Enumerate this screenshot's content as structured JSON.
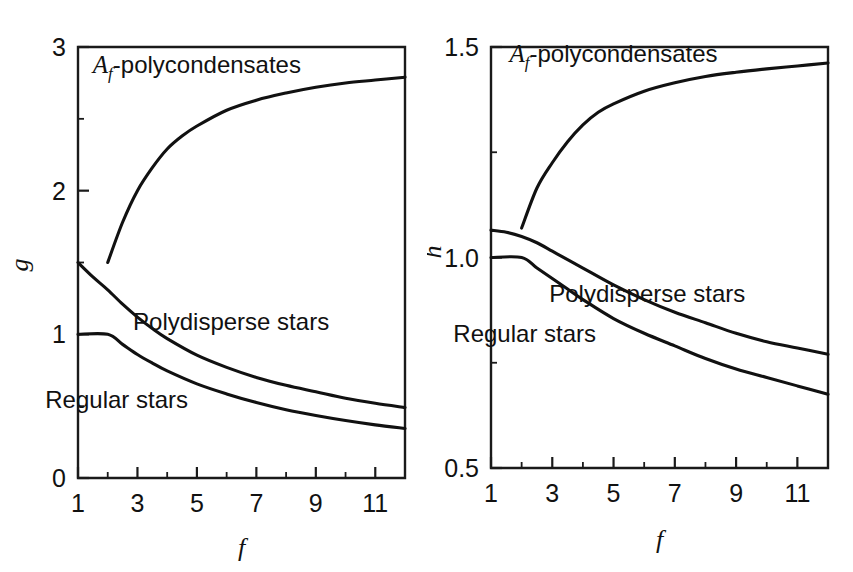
{
  "figure": {
    "background_color": "#ffffff",
    "line_color": "#111111",
    "panel_count": 2
  },
  "chart_data": [
    {
      "type": "line",
      "panel": "left",
      "title": "",
      "xlabel": "f",
      "ylabel": "g",
      "xlim": [
        1,
        12
      ],
      "ylim": [
        0,
        3
      ],
      "grid": false,
      "legend": "inline-annotations",
      "x_major_ticks": [
        1,
        3,
        5,
        7,
        9,
        11
      ],
      "x_major_tick_labels": [
        "1",
        "3",
        "5",
        "7",
        "9",
        "11"
      ],
      "x_minor_ticks": [
        2,
        4,
        6,
        8,
        10,
        12
      ],
      "y_major_ticks": [
        0,
        1,
        2,
        3
      ],
      "y_major_tick_labels": [
        "0",
        "1",
        "2",
        "3"
      ],
      "y_minor_ticks": [
        0.5,
        1.5,
        2.5
      ],
      "series": [
        {
          "name": "Af-polycondensates",
          "label": "A_f-polycondensates",
          "label_x": 5.0,
          "label_y": 2.82,
          "x": [
            2,
            2.5,
            3,
            3.5,
            4,
            4.5,
            5,
            6,
            7,
            8,
            9,
            10,
            11,
            12
          ],
          "values": [
            1.5,
            1.78,
            2.0,
            2.16,
            2.29,
            2.38,
            2.45,
            2.56,
            2.63,
            2.68,
            2.72,
            2.75,
            2.77,
            2.79
          ]
        },
        {
          "name": "Polydisperse stars",
          "label": "Polydisperse stars",
          "label_x": 6.15,
          "label_y": 1.03,
          "x": [
            1,
            1.5,
            2,
            2.5,
            3,
            3.5,
            4,
            5,
            6,
            7,
            8,
            9,
            10,
            11,
            12
          ],
          "values": [
            1.5,
            1.4,
            1.31,
            1.21,
            1.12,
            1.04,
            0.97,
            0.855,
            0.77,
            0.7,
            0.645,
            0.6,
            0.555,
            0.52,
            0.49
          ]
        },
        {
          "name": "Regular stars",
          "label": "Regular stars",
          "label_x": 2.3,
          "label_y": 0.49,
          "x": [
            1,
            2,
            2.5,
            3,
            3.5,
            4,
            5,
            6,
            7,
            8,
            9,
            10,
            11,
            12
          ],
          "values": [
            1.0,
            1.0,
            0.93,
            0.86,
            0.8,
            0.745,
            0.655,
            0.585,
            0.525,
            0.475,
            0.435,
            0.4,
            0.37,
            0.345
          ]
        }
      ]
    },
    {
      "type": "line",
      "panel": "right",
      "title": "",
      "xlabel": "f",
      "ylabel": "h",
      "xlim": [
        1,
        12
      ],
      "ylim": [
        0.5,
        1.5
      ],
      "grid": false,
      "legend": "inline-annotations",
      "x_major_ticks": [
        1,
        3,
        5,
        7,
        9,
        11
      ],
      "x_major_tick_labels": [
        "1",
        "3",
        "5",
        "7",
        "9",
        "11"
      ],
      "x_minor_ticks": [
        2,
        4,
        6,
        8,
        10,
        12
      ],
      "y_major_ticks": [
        0.5,
        1.0,
        1.5
      ],
      "y_major_tick_labels": [
        "0.5",
        "1.0",
        "1.5"
      ],
      "y_minor_ticks": [
        0.75,
        1.25
      ],
      "series": [
        {
          "name": "Af-polycondensates",
          "label": "A_f-polycondensates",
          "label_x": 5.0,
          "label_y": 1.465,
          "x": [
            2,
            2.5,
            3,
            3.5,
            4,
            4.5,
            5,
            6,
            7,
            8,
            9,
            10,
            11,
            12
          ],
          "values": [
            1.07,
            1.165,
            1.225,
            1.275,
            1.315,
            1.345,
            1.365,
            1.395,
            1.415,
            1.43,
            1.44,
            1.448,
            1.455,
            1.462
          ]
        },
        {
          "name": "Polydisperse stars",
          "label": "Polydisperse stars",
          "label_x": 6.1,
          "label_y": 0.895,
          "x": [
            1,
            1.5,
            2,
            2.5,
            3,
            3.5,
            4,
            5,
            6,
            7,
            8,
            9,
            10,
            11,
            12
          ],
          "values": [
            1.065,
            1.06,
            1.05,
            1.035,
            1.015,
            0.995,
            0.975,
            0.935,
            0.9,
            0.87,
            0.845,
            0.82,
            0.8,
            0.785,
            0.77
          ]
        },
        {
          "name": "Regular stars",
          "label": "Regular stars",
          "label_x": 2.1,
          "label_y": 0.8,
          "x": [
            1,
            2,
            2.5,
            3,
            3.5,
            4,
            5,
            6,
            7,
            8,
            9,
            10,
            11,
            12
          ],
          "values": [
            1.0,
            1.0,
            0.975,
            0.95,
            0.925,
            0.9,
            0.855,
            0.82,
            0.79,
            0.76,
            0.735,
            0.715,
            0.695,
            0.675
          ]
        }
      ]
    }
  ]
}
